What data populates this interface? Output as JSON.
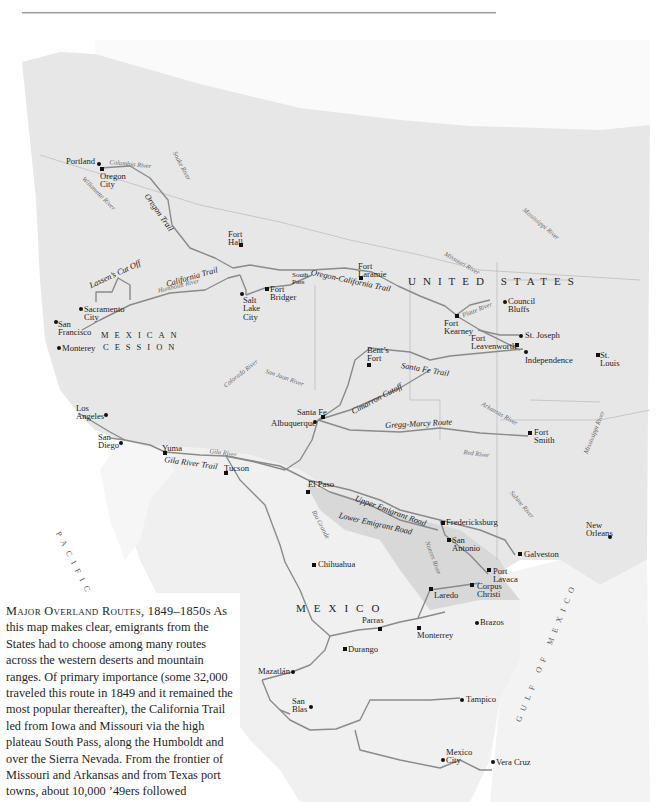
{
  "caption": {
    "title": "Major Overland Routes, 1849–1850s",
    "body": "As this map makes clear, emigrants from the States had to choose among many routes across the western deserts and mountain ranges. Of primary importance (some 32,000 traveled this route in 1849 and it remained the most popular thereafter), the California Trail led from Iowa and Missouri via the high plateau South Pass, along the Humboldt and over the Sierra Nevada. From the frontier of Missouri and Arkansas and from Texas port towns, about 10,000 ’49ers followed"
  },
  "regions": {
    "united_states": "UNITED STATES",
    "mexican_cession_1": "MEXICAN",
    "mexican_cession_2": "CESSION",
    "mexico": "MEXICO",
    "pacific": "PACIFIC",
    "gulf": "GULF OF MEXICO"
  },
  "trails": {
    "oregon": "Oregon Trail",
    "lassen": "Lassen’s Cut Off",
    "california": "California Trail",
    "oregon_california": "Oregon-California Trail",
    "santa_fe": "Santa Fe Trail",
    "cimarron": "Cimarron Cutoff",
    "gregg_marcy": "Gregg-Marcy Route",
    "gila": "Gila River Trail",
    "upper": "Upper Emigrant Road",
    "lower": "Lower Emigrant Road"
  },
  "rivers": {
    "columbia": "Columbia River",
    "snake": "Snake River",
    "willamette": "Willamette River",
    "humboldt": "Humboldt River",
    "missouri": "Missouri River",
    "mississippi_n": "Mississippi River",
    "platte": "Platte River",
    "colorado": "Colorado River",
    "san_juan": "San Juan River",
    "arkansas": "Arkansas River",
    "red": "Red River",
    "mississippi_s": "Mississippi River",
    "gila": "Gila River",
    "rio_grande": "Rio Grande",
    "sabine": "Sabine River",
    "nueces": "Nueces River"
  },
  "places": {
    "portland": "Portland",
    "oregon_city": "Oregon City",
    "fort_hall": "Fort Hall",
    "south_pass": "South Pass",
    "fort_laramie": "Fort Laramie",
    "salt_lake_city": "Salt Lake City",
    "fort_bridger": "Fort Bridger",
    "sacramento": "Sacramento City",
    "san_francisco": "San Francisco",
    "monterey": "Monterey",
    "council_bluffs": "Council Bluffs",
    "fort_kearney": "Fort Kearney",
    "st_joseph": "St. Joseph",
    "fort_leavenworth": "Fort Leavenworth",
    "independence": "Independence",
    "st_louis": "St. Louis",
    "bents_fort": "Bent’s Fort",
    "santa_fe": "Santa Fe",
    "albuquerque": "Albuquerque",
    "fort_smith": "Fort Smith",
    "los_angeles": "Los Angeles",
    "san_diego": "San Diego",
    "yuma": "Yuma",
    "tucson": "Tucson",
    "el_paso": "El Paso",
    "fredericksburg": "Fredericksburg",
    "san_antonio": "San Antonio",
    "galveston": "Galveston",
    "new_orleans": "New Orleans",
    "port_lavaca": "Port Lavaca",
    "corpus_christi": "Corpus Christi",
    "laredo": "Laredo",
    "chihuahua": "Chihuahua",
    "parras": "Parras",
    "monterrey": "Monterrey",
    "brazos": "Brazos",
    "durango": "Durango",
    "mazatlan": "Mazatlán",
    "san_blas": "San Blas",
    "tampico": "Tampico",
    "mexico_city": "Mexico City",
    "vera_cruz": "Vera Cruz"
  },
  "colors": {
    "land_us": "#e6e6e6",
    "land_mx": "#eeeeee",
    "texas": "#d9d9d9",
    "route": "#8a8a8a",
    "border": "#b5b5b5"
  }
}
